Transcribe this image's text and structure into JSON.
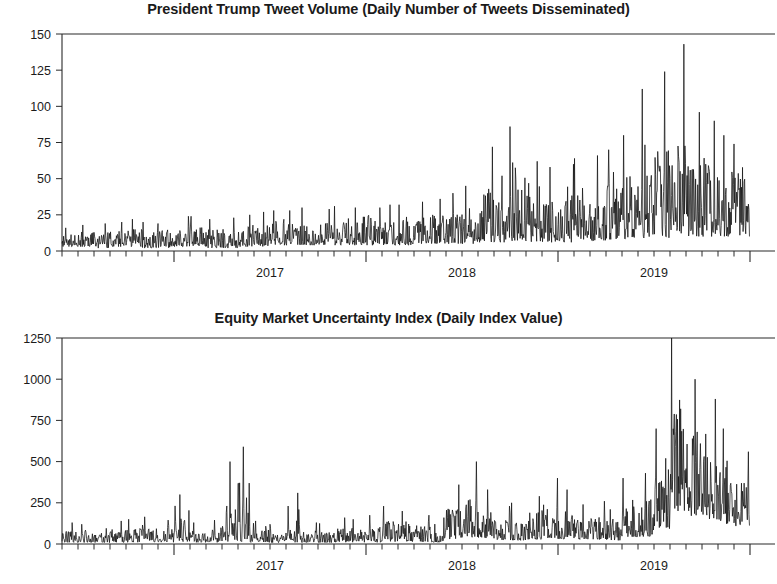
{
  "figure": {
    "width": 777,
    "height": 584,
    "background": "#ffffff",
    "line_color": "#111111",
    "axis_color": "#2a2a2a",
    "text_color": "#1b1b1b"
  },
  "panels": [
    {
      "id": "tweet-volume",
      "title": "President Trump Tweet Volume (Daily Number of Tweets Disseminated)",
      "ylabel": "",
      "xlabel": ""
    },
    {
      "id": "equity-uncertainty",
      "title": "Equity Market Uncertainty Index (Daily Index Value)",
      "ylabel": "",
      "xlabel": ""
    }
  ],
  "chart_data": [
    {
      "type": "line",
      "id": "tweet-volume",
      "title": "President Trump Tweet Volume (Daily Number of Tweets Disseminated)",
      "xlabel": "",
      "ylabel": "",
      "ylim": [
        0,
        150
      ],
      "yticks": [
        0,
        25,
        50,
        75,
        100,
        125,
        150
      ],
      "ytick_labels": [
        "0",
        "25",
        "50",
        "75",
        "100",
        "125",
        "150"
      ],
      "xlim": [
        "2016-06",
        "2019-12"
      ],
      "xticks": [
        "2017",
        "2018",
        "2019"
      ],
      "xtick_labels": [
        "2017",
        "2018",
        "2019"
      ],
      "minor_xticks": "monthly",
      "grid": false,
      "legend": null,
      "series": [
        {
          "name": "Daily tweet count",
          "note": "Daily series, approx. mid-2016 through late-2019; level rises from ~8/day in 2016 to ~35/day in 2019 with spikes up to ~143.",
          "monthly_summary": [
            {
              "month": "2016-06",
              "mean": 8,
              "max": 16,
              "min": 3
            },
            {
              "month": "2016-07",
              "mean": 9,
              "max": 18,
              "min": 3
            },
            {
              "month": "2016-08",
              "mean": 9,
              "max": 19,
              "min": 2
            },
            {
              "month": "2016-09",
              "mean": 9,
              "max": 20,
              "min": 3
            },
            {
              "month": "2016-10",
              "mean": 10,
              "max": 22,
              "min": 3
            },
            {
              "month": "2016-11",
              "mean": 9,
              "max": 20,
              "min": 2
            },
            {
              "month": "2016-12",
              "mean": 9,
              "max": 19,
              "min": 2
            },
            {
              "month": "2017-01",
              "mean": 10,
              "max": 24,
              "min": 3
            },
            {
              "month": "2017-02",
              "mean": 11,
              "max": 24,
              "min": 3
            },
            {
              "month": "2017-03",
              "mean": 10,
              "max": 22,
              "min": 2
            },
            {
              "month": "2017-04",
              "mean": 10,
              "max": 23,
              "min": 2
            },
            {
              "month": "2017-05",
              "mean": 11,
              "max": 25,
              "min": 3
            },
            {
              "month": "2017-06",
              "mean": 12,
              "max": 27,
              "min": 3
            },
            {
              "month": "2017-07",
              "mean": 13,
              "max": 28,
              "min": 4
            },
            {
              "month": "2017-08",
              "mean": 13,
              "max": 28,
              "min": 4
            },
            {
              "month": "2017-09",
              "mean": 14,
              "max": 30,
              "min": 4
            },
            {
              "month": "2017-10",
              "mean": 13,
              "max": 29,
              "min": 4
            },
            {
              "month": "2017-11",
              "mean": 14,
              "max": 31,
              "min": 4
            },
            {
              "month": "2017-12",
              "mean": 14,
              "max": 30,
              "min": 4
            },
            {
              "month": "2018-01",
              "mean": 14,
              "max": 30,
              "min": 4
            },
            {
              "month": "2018-02",
              "mean": 15,
              "max": 32,
              "min": 4
            },
            {
              "month": "2018-03",
              "mean": 15,
              "max": 32,
              "min": 4
            },
            {
              "month": "2018-04",
              "mean": 16,
              "max": 34,
              "min": 5
            },
            {
              "month": "2018-05",
              "mean": 17,
              "max": 36,
              "min": 5
            },
            {
              "month": "2018-06",
              "mean": 18,
              "max": 40,
              "min": 5
            },
            {
              "month": "2018-07",
              "mean": 19,
              "max": 45,
              "min": 5
            },
            {
              "month": "2018-08",
              "mean": 22,
              "max": 72,
              "min": 6
            },
            {
              "month": "2018-09",
              "mean": 22,
              "max": 52,
              "min": 6
            },
            {
              "month": "2018-10",
              "mean": 25,
              "max": 86,
              "min": 7
            },
            {
              "month": "2018-11",
              "mean": 24,
              "max": 62,
              "min": 6
            },
            {
              "month": "2018-12",
              "mean": 24,
              "max": 58,
              "min": 6
            },
            {
              "month": "2019-01",
              "mean": 25,
              "max": 60,
              "min": 6
            },
            {
              "month": "2019-02",
              "mean": 26,
              "max": 64,
              "min": 7
            },
            {
              "month": "2019-03",
              "mean": 27,
              "max": 66,
              "min": 7
            },
            {
              "month": "2019-04",
              "mean": 30,
              "max": 70,
              "min": 8
            },
            {
              "month": "2019-05",
              "mean": 32,
              "max": 80,
              "min": 8
            },
            {
              "month": "2019-06",
              "mean": 34,
              "max": 112,
              "min": 9
            },
            {
              "month": "2019-07",
              "mean": 36,
              "max": 124,
              "min": 9
            },
            {
              "month": "2019-08",
              "mean": 38,
              "max": 143,
              "min": 10
            },
            {
              "month": "2019-09",
              "mean": 36,
              "max": 96,
              "min": 10
            },
            {
              "month": "2019-10",
              "mean": 37,
              "max": 90,
              "min": 10
            },
            {
              "month": "2019-11",
              "mean": 35,
              "max": 80,
              "min": 10
            },
            {
              "month": "2019-12",
              "mean": 34,
              "max": 74,
              "min": 10
            }
          ],
          "peak_value": 143,
          "peak_date": "2019-08"
        }
      ]
    },
    {
      "type": "line",
      "id": "equity-uncertainty",
      "title": "Equity Market Uncertainty Index (Daily Index Value)",
      "xlabel": "",
      "ylabel": "",
      "ylim": [
        0,
        1250
      ],
      "yticks": [
        0,
        250,
        500,
        750,
        1000,
        1250
      ],
      "ytick_labels": [
        "0",
        "250",
        "500",
        "750",
        "1000",
        "1250"
      ],
      "xlim": [
        "2016-06",
        "2019-12"
      ],
      "xticks": [
        "2017",
        "2018",
        "2019"
      ],
      "xtick_labels": [
        "2017",
        "2018",
        "2019"
      ],
      "minor_xticks": "monthly",
      "grid": false,
      "legend": null,
      "series": [
        {
          "name": "Daily equity market uncertainty index",
          "note": "Low baseline (~30-90) through 2016-2017 with isolated spikes; elevated/volatile in late 2018; sharp surge to ~1250 in mid-to-late 2019.",
          "monthly_summary": [
            {
              "month": "2016-06",
              "mean": 45,
              "max": 130,
              "min": 10
            },
            {
              "month": "2016-07",
              "mean": 42,
              "max": 120,
              "min": 10
            },
            {
              "month": "2016-08",
              "mean": 38,
              "max": 95,
              "min": 8
            },
            {
              "month": "2016-09",
              "mean": 45,
              "max": 140,
              "min": 10
            },
            {
              "month": "2016-10",
              "mean": 48,
              "max": 150,
              "min": 10
            },
            {
              "month": "2016-11",
              "mean": 55,
              "max": 165,
              "min": 12
            },
            {
              "month": "2016-12",
              "mean": 50,
              "max": 145,
              "min": 10
            },
            {
              "month": "2017-01",
              "mean": 60,
              "max": 300,
              "min": 12
            },
            {
              "month": "2017-02",
              "mean": 48,
              "max": 130,
              "min": 10
            },
            {
              "month": "2017-03",
              "mean": 50,
              "max": 145,
              "min": 10
            },
            {
              "month": "2017-04",
              "mean": 55,
              "max": 500,
              "min": 10
            },
            {
              "month": "2017-05",
              "mean": 58,
              "max": 590,
              "min": 10
            },
            {
              "month": "2017-06",
              "mean": 45,
              "max": 140,
              "min": 10
            },
            {
              "month": "2017-07",
              "mean": 42,
              "max": 120,
              "min": 8
            },
            {
              "month": "2017-08",
              "mean": 50,
              "max": 310,
              "min": 10
            },
            {
              "month": "2017-09",
              "mean": 44,
              "max": 130,
              "min": 8
            },
            {
              "month": "2017-10",
              "mean": 42,
              "max": 125,
              "min": 8
            },
            {
              "month": "2017-11",
              "mean": 48,
              "max": 160,
              "min": 10
            },
            {
              "month": "2017-12",
              "mean": 45,
              "max": 150,
              "min": 10
            },
            {
              "month": "2018-01",
              "mean": 50,
              "max": 175,
              "min": 10
            },
            {
              "month": "2018-02",
              "mean": 70,
              "max": 230,
              "min": 15
            },
            {
              "month": "2018-03",
              "mean": 65,
              "max": 200,
              "min": 14
            },
            {
              "month": "2018-04",
              "mean": 58,
              "max": 175,
              "min": 12
            },
            {
              "month": "2018-05",
              "mean": 52,
              "max": 160,
              "min": 10
            },
            {
              "month": "2018-06",
              "mean": 120,
              "max": 360,
              "min": 30
            },
            {
              "month": "2018-07",
              "mean": 150,
              "max": 500,
              "min": 40
            },
            {
              "month": "2018-08",
              "mean": 125,
              "max": 330,
              "min": 35
            },
            {
              "month": "2018-09",
              "mean": 85,
              "max": 230,
              "min": 25
            },
            {
              "month": "2018-10",
              "mean": 80,
              "max": 250,
              "min": 22
            },
            {
              "month": "2018-11",
              "mean": 95,
              "max": 290,
              "min": 28
            },
            {
              "month": "2018-12",
              "mean": 130,
              "max": 400,
              "min": 35
            },
            {
              "month": "2019-01",
              "mean": 110,
              "max": 330,
              "min": 30
            },
            {
              "month": "2019-02",
              "mean": 85,
              "max": 240,
              "min": 25
            },
            {
              "month": "2019-03",
              "mean": 90,
              "max": 260,
              "min": 25
            },
            {
              "month": "2019-04",
              "mean": 80,
              "max": 210,
              "min": 22
            },
            {
              "month": "2019-05",
              "mean": 135,
              "max": 400,
              "min": 40
            },
            {
              "month": "2019-06",
              "mean": 150,
              "max": 430,
              "min": 45
            },
            {
              "month": "2019-07",
              "mean": 300,
              "max": 700,
              "min": 90
            },
            {
              "month": "2019-08",
              "mean": 620,
              "max": 1250,
              "min": 200
            },
            {
              "month": "2019-09",
              "mean": 480,
              "max": 1000,
              "min": 170
            },
            {
              "month": "2019-10",
              "mean": 430,
              "max": 880,
              "min": 150
            },
            {
              "month": "2019-11",
              "mean": 330,
              "max": 700,
              "min": 120
            },
            {
              "month": "2019-12",
              "mean": 280,
              "max": 560,
              "min": 110
            }
          ],
          "peak_value": 1250,
          "peak_date": "2019-08"
        }
      ]
    }
  ]
}
